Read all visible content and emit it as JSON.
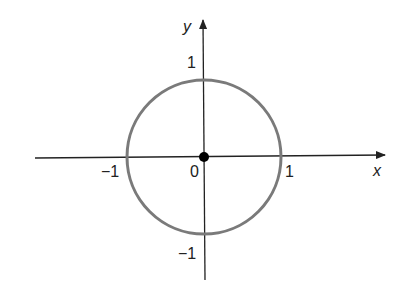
{
  "diagram": {
    "title": "",
    "axes": {
      "x_label": "x",
      "y_label": "y",
      "x_ticks": [
        {
          "value": -1,
          "label": "−1"
        },
        {
          "value": 0,
          "label": "0"
        },
        {
          "value": 1,
          "label": "1"
        }
      ],
      "y_ticks": [
        {
          "value": 1,
          "label": "1"
        },
        {
          "value": -1,
          "label": "−1"
        }
      ]
    },
    "shapes": [
      {
        "type": "circle",
        "center": [
          0,
          0
        ],
        "radius": 1,
        "stroke": "#7a7a7a"
      },
      {
        "type": "point",
        "at": [
          0,
          0
        ],
        "fill": "#000000"
      }
    ],
    "colors": {
      "axis": "#222222",
      "circle": "#7a7a7a",
      "origin_point": "#000000",
      "background": "#ffffff"
    }
  }
}
